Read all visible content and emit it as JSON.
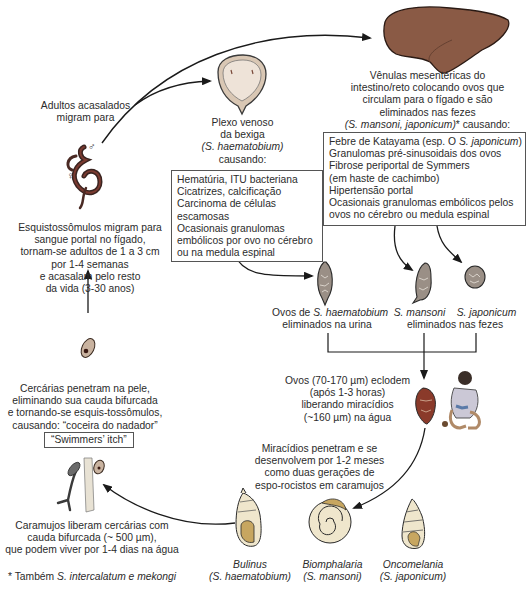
{
  "diagram": {
    "nodes": {
      "adults_mate": {
        "lines": [
          "Adultos acasalados",
          "migram para"
        ],
        "male_symbol": "♂",
        "female_symbol": "♀"
      },
      "bladder": {
        "lines": [
          "Plexo venoso",
          "da bexiga"
        ],
        "species": "(S. haematobium)",
        "suffix": "causando:"
      },
      "bladder_box": {
        "items": [
          "Hematúria, ITU bacteriana",
          "Cicatrizes, calcificação",
          "Carcinoma de células",
          "escamosas",
          "Ocasionais granulomas",
          "embólicos por ovo no cérebro",
          "ou na medula espinal"
        ]
      },
      "mesenteric": {
        "lines": [
          "Vênulas mesentéricas do",
          "intestino/reto colocando ovos que",
          "circulam para o fígado e são",
          "eliminados nas fezes"
        ],
        "species": "(S. mansoni, japonicum)",
        "suffix": "* causando:"
      },
      "mesenteric_box": {
        "line1_prefix": "Febre de Katayama (esp. O ",
        "line1_species": "S. japonicum",
        "line1_suffix": ")",
        "items": [
          "Granulomas pré-sinusoidais dos ovos",
          "Fibrose periportal de Symmers",
          "(em haste de cachimbo)",
          "Hipertensão portal",
          "Ocasionais granulomas embólicos pelos",
          "ovos no cérebro ou medula espinal"
        ]
      },
      "schistosomula": {
        "lines": [
          "Esquistossômulos migram para",
          "sangue portal no fígado,",
          "tornam-se adultos de 1 a 3 cm",
          "por 1-4 semanas",
          "e acasalam pelo resto",
          "da vida (3-30 anos)"
        ]
      },
      "eggs_haematobium": {
        "prefix": "Ovos de ",
        "species": "S. haematobium",
        "line2": "eliminados na urina"
      },
      "eggs_intestinal": {
        "species1": "S. mansoni",
        "species2": "S. japonicum",
        "line2": "eliminados nas fezes"
      },
      "hatch": {
        "lines": [
          "Ovos (70-170 µm) eclodem",
          "(após 1-3 horas)",
          "liberando miracídios",
          "(~160 µm) na água"
        ]
      },
      "miracidia": {
        "lines": [
          "Miracídios penetram e se",
          "desenvolvem por 1-2 meses",
          "como duas gerações de",
          "espo-rocistos em caramujos"
        ]
      },
      "snails": [
        {
          "genus": "Bulinus",
          "species": "(S. haematobium)"
        },
        {
          "genus": "Biomphalaria",
          "species": "(S. mansoni)"
        },
        {
          "genus": "Oncomelania",
          "species": "(S. japonicum)"
        }
      ],
      "cercariae_release": {
        "lines": [
          "Caramujos liberam cercárias com",
          "cauda bifurcada (~ 500 µm),",
          "que podem viver por 1-4 dias na água"
        ]
      },
      "cercariae_penetrate": {
        "lines": [
          "Cercárias penetram na pele,",
          "eliminando sua cauda bifurcada",
          "e tornando-se esquis-tossômulos,",
          "causando: “coceira do nadador”"
        ],
        "badge": "“Swimmers’ itch”"
      },
      "footnote": {
        "prefix": "* Também ",
        "species": "S. intercalatum e mekongi"
      }
    },
    "colors": {
      "liver": "#8a5a45",
      "liver_outline": "#2a1a14",
      "worm": "#4a2a24",
      "worm_red": "#8b1a1a",
      "bladder_fill": "#e8d8c8",
      "snail_fill": "#efe6cc",
      "snail_shadow": "#c7a660",
      "egg_fill": "#9a8f86",
      "cercaria_fill": "#c9b3a0",
      "arrow": "#1a1a1a",
      "text": "#2b2b2b"
    }
  }
}
